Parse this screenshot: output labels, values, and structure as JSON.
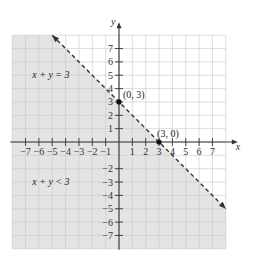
{
  "chart_data": {
    "type": "line",
    "title": "",
    "xlabel": "x",
    "ylabel": "y",
    "xlim": [
      -8,
      8
    ],
    "ylim": [
      -8,
      8
    ],
    "grid": true,
    "x_ticks": [
      -7,
      -6,
      -5,
      -4,
      -3,
      -2,
      -1,
      1,
      2,
      3,
      4,
      5,
      6,
      7
    ],
    "y_ticks": [
      7,
      6,
      5,
      4,
      3,
      2,
      1,
      -2,
      -3,
      -4,
      -5,
      -6,
      -7
    ],
    "x_tick_labels": [
      "−7",
      "−6",
      "−5",
      "−4",
      "−3",
      "−2",
      "−1",
      "1",
      "2",
      "3",
      "4",
      "5",
      "6",
      "7"
    ],
    "y_tick_labels": [
      "7",
      "6",
      "5",
      "4",
      "3",
      "2",
      "1",
      "−2",
      "−3",
      "−4",
      "−5",
      "−6",
      "−7"
    ],
    "boundary_line": {
      "equation": "x + y = 3",
      "style": "dashed",
      "from": [
        -5,
        8
      ],
      "to": [
        8,
        -5
      ],
      "arrows": "both"
    },
    "shaded_region": {
      "inequality": "x + y < 3",
      "side": "below-left"
    },
    "points": [
      {
        "x": 0,
        "y": 3,
        "label": "(0, 3)"
      },
      {
        "x": 3,
        "y": 0,
        "label": "(3, 0)"
      }
    ],
    "annotations": [
      {
        "text": "x + y = 3",
        "at": [
          -6.5,
          5
        ]
      },
      {
        "text": "x + y < 3",
        "at": [
          -6.5,
          -3
        ]
      }
    ],
    "colors": {
      "shade": "#e4e4e4",
      "grid": "#c8c8c8",
      "axis": "#333333",
      "line": "#333333"
    }
  }
}
